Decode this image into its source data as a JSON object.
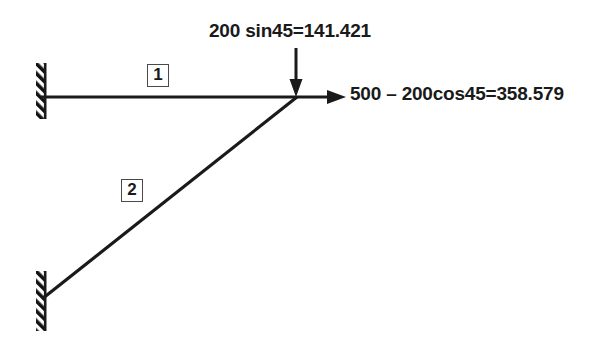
{
  "diagram": {
    "stroke_color": "#1a1a1a",
    "tag_border_color": "#4a4a4a",
    "background_color": "#ffffff",
    "members": [
      {
        "tag": "1",
        "type": "horizontal-member",
        "from": {
          "x": 41,
          "y": 97
        },
        "to": {
          "x": 296,
          "y": 97
        }
      },
      {
        "tag": "2",
        "type": "diagonal-member",
        "from": {
          "x": 42,
          "y": 299
        },
        "to": {
          "x": 296,
          "y": 97
        }
      }
    ],
    "joint": {
      "x": 296,
      "y": 97
    },
    "supports": [
      {
        "name": "upper-fixed-support",
        "x": 36,
        "y_top": 63,
        "y_bottom": 119
      },
      {
        "name": "lower-fixed-support",
        "x": 36,
        "y_top": 271,
        "y_bottom": 331
      }
    ],
    "forces": [
      {
        "name": "vertical-force",
        "label": "200 sin45=141.421",
        "direction": "down",
        "tail": {
          "x": 296,
          "y": 48
        },
        "tip": {
          "x": 296,
          "y": 96
        }
      },
      {
        "name": "horizontal-force",
        "label": "500 – 200cos45=358.579",
        "direction": "right",
        "tail": {
          "x": 297,
          "y": 97
        },
        "tip": {
          "x": 346,
          "y": 97
        }
      }
    ]
  }
}
